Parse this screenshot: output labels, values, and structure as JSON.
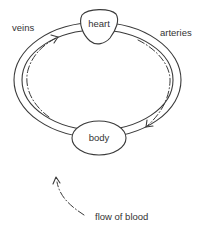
{
  "diagram": {
    "type": "circulation-loop",
    "nodes": {
      "heart": {
        "label": "heart"
      },
      "body": {
        "label": "body"
      }
    },
    "vessels": {
      "veins": {
        "label": "veins",
        "direction": "body-to-heart"
      },
      "arteries": {
        "label": "arteries",
        "direction": "heart-to-body"
      }
    },
    "legend": {
      "flow_label": "flow of blood"
    },
    "colors": {
      "stroke": "#3a3a3a",
      "text": "#333333",
      "background": "#ffffff"
    }
  }
}
